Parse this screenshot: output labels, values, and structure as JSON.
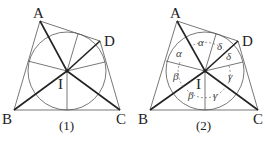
{
  "figures": [
    {
      "caption": "(1)",
      "points": {
        "A": "A",
        "B": "B",
        "C": "C",
        "D": "D",
        "I": "I"
      }
    },
    {
      "caption": "(2)",
      "points": {
        "A": "A",
        "B": "B",
        "C": "C",
        "D": "D",
        "I": "I"
      },
      "angles": {
        "alpha1": "α",
        "alpha2": "α",
        "delta1": "δ",
        "delta2": "δ",
        "beta1": "β",
        "beta2": "β",
        "gamma1": "γ",
        "gamma2": "γ"
      }
    }
  ]
}
